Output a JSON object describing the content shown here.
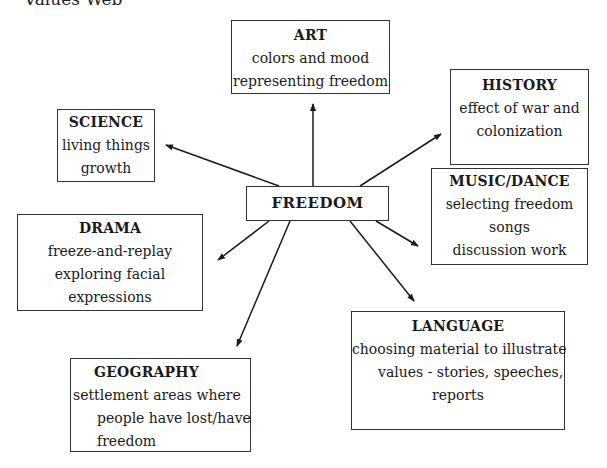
{
  "header": {
    "title": "Values Web"
  },
  "center": {
    "label": "FREEDOM"
  },
  "nodes": {
    "art": {
      "title": "ART",
      "lines": [
        "colors and mood",
        "representing freedom"
      ]
    },
    "history": {
      "title": "HISTORY",
      "lines": [
        "effect of war and",
        "colonization"
      ]
    },
    "science": {
      "title": "SCIENCE",
      "lines": [
        "living things",
        "growth"
      ]
    },
    "music": {
      "title": "MUSIC/DANCE",
      "lines": [
        "selecting freedom",
        "songs",
        "discussion work"
      ]
    },
    "drama": {
      "title": "DRAMA",
      "lines": [
        "freeze-and-replay",
        "exploring facial",
        "expressions"
      ]
    },
    "language": {
      "title": "LANGUAGE",
      "lines": [
        "choosing material to illustrate",
        "values - stories, speeches,",
        "reports"
      ]
    },
    "geography": {
      "title": "GEOGRAPHY",
      "lines": [
        "settlement areas where",
        "people have lost/have",
        "freedom"
      ]
    }
  }
}
